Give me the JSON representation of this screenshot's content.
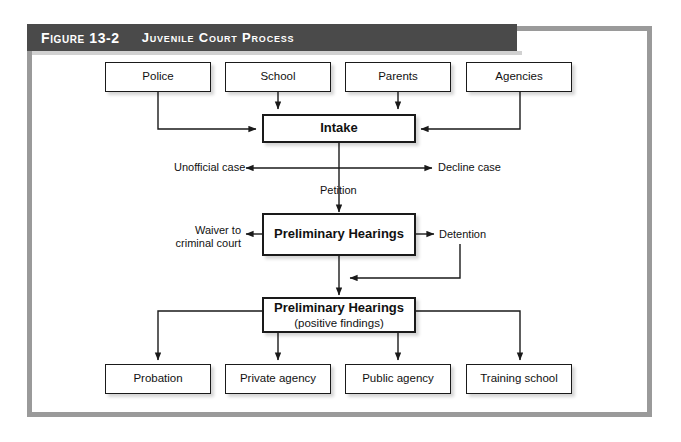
{
  "figure": {
    "number_label": "Figure 13-2",
    "title": "Juvenile Court Process",
    "banner_color": "#4a4a4a",
    "frame_color": "#9a9a9a"
  },
  "nodes": {
    "sources": [
      {
        "id": "police",
        "label": "Police"
      },
      {
        "id": "school",
        "label": "School"
      },
      {
        "id": "parents",
        "label": "Parents"
      },
      {
        "id": "agencies",
        "label": "Agencies"
      }
    ],
    "intake": {
      "label": "Intake"
    },
    "prelim1": {
      "label": "Preliminary Hearings"
    },
    "prelim2": {
      "label": "Preliminary Hearings",
      "sub": "(positive findings)"
    },
    "outcomes": [
      {
        "id": "probation",
        "label": "Probation"
      },
      {
        "id": "private-agency",
        "label": "Private agency"
      },
      {
        "id": "public-agency",
        "label": "Public agency"
      },
      {
        "id": "training-school",
        "label": "Training school"
      }
    ]
  },
  "edge_labels": {
    "unofficial_case": "Unofficial case",
    "decline_case": "Decline case",
    "petition": "Petition",
    "waiver_line1": "Waiver to",
    "waiver_line2": "criminal court",
    "detention": "Detention"
  }
}
